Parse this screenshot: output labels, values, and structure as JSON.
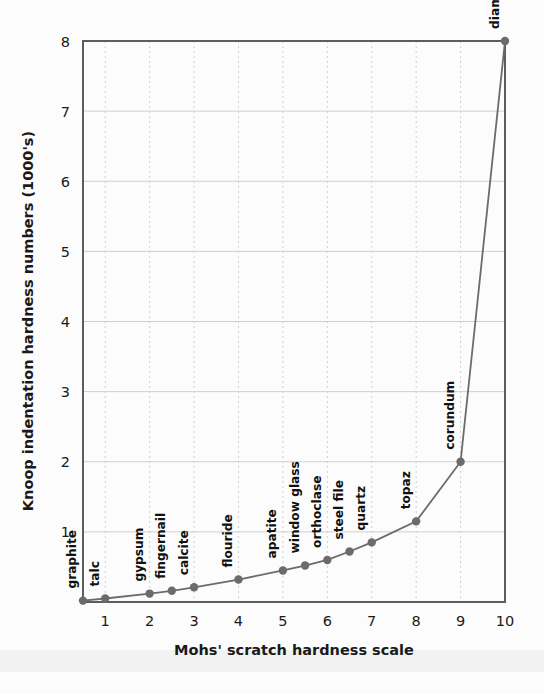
{
  "chart_data": {
    "type": "line",
    "title": "",
    "xlabel": "Mohs' scratch hardness scale",
    "ylabel": "Knoop indentation hardness numbers (1000's)",
    "xlim": [
      0.5,
      10
    ],
    "ylim": [
      0,
      8
    ],
    "xticks": [
      1,
      2,
      3,
      4,
      5,
      6,
      7,
      8,
      9,
      10
    ],
    "yticks": [
      1,
      2,
      3,
      4,
      5,
      6,
      7,
      8
    ],
    "xtick_labels": [
      "1",
      "2",
      "3",
      "4",
      "5",
      "6",
      "7",
      "8",
      "9",
      "10"
    ],
    "ytick_labels": [
      "1",
      "2",
      "3",
      "4",
      "5",
      "6",
      "7",
      "8"
    ],
    "grid": true,
    "legend": "none",
    "series": [
      {
        "name": "Knoop hardness vs Mohs scale",
        "line_color": "#6b6b6b",
        "marker_color": "#6b6b6b",
        "points": [
          {
            "label": "graphite",
            "x": 0.5,
            "y": 0.02
          },
          {
            "label": "talc",
            "x": 1.0,
            "y": 0.05
          },
          {
            "label": "gypsum",
            "x": 2.0,
            "y": 0.12
          },
          {
            "label": "fingernail",
            "x": 2.5,
            "y": 0.16
          },
          {
            "label": "calcite",
            "x": 3.0,
            "y": 0.21
          },
          {
            "label": "flouride",
            "x": 4.0,
            "y": 0.32
          },
          {
            "label": "apatite",
            "x": 5.0,
            "y": 0.45
          },
          {
            "label": "window glass",
            "x": 5.5,
            "y": 0.52
          },
          {
            "label": "orthoclase",
            "x": 6.0,
            "y": 0.6
          },
          {
            "label": "steel file",
            "x": 6.5,
            "y": 0.72
          },
          {
            "label": "quartz",
            "x": 7.0,
            "y": 0.85
          },
          {
            "label": "topaz",
            "x": 8.0,
            "y": 1.15
          },
          {
            "label": "corundum",
            "x": 9.0,
            "y": 2.0
          },
          {
            "label": "diamond",
            "x": 10.0,
            "y": 8.0
          }
        ]
      }
    ]
  },
  "style": {
    "background_color": "#fcfcfc",
    "plot_border_color": "#5d5d5d",
    "grid_color": "#cfcfcf",
    "text_color": "#1a1a1a",
    "series_color": "#6b6b6b"
  }
}
